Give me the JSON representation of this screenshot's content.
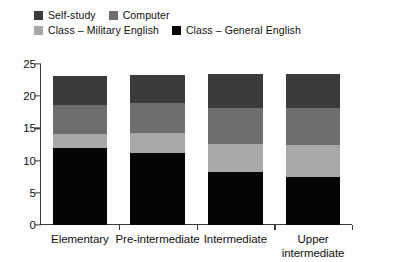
{
  "chart_data": {
    "type": "bar",
    "subtype": "stacked-bar",
    "title": "",
    "xlabel": "",
    "ylabel": "",
    "ylim": [
      0,
      25
    ],
    "yticks": [
      0,
      5,
      10,
      15,
      20,
      25
    ],
    "grid": false,
    "legend_position": "top-left",
    "categories": [
      "Elementary",
      "Pre-intermediate",
      "Intermediate",
      "Upper intermediate"
    ],
    "category_lines": [
      [
        "Elementary"
      ],
      [
        "Pre-intermediate"
      ],
      [
        "Intermediate"
      ],
      [
        "Upper",
        "intermediate"
      ]
    ],
    "series": [
      {
        "name": "Class – General English",
        "color": "#050505",
        "values": [
          12.0,
          11.2,
          8.3,
          7.4
        ]
      },
      {
        "name": "Class – Military English",
        "color": "#a8a8a8",
        "values": [
          2.2,
          3.1,
          4.3,
          5.1
        ]
      },
      {
        "name": "Computer",
        "color": "#6e6e6e",
        "values": [
          4.5,
          4.7,
          5.5,
          5.6
        ]
      },
      {
        "name": "Self-study",
        "color": "#3b3b3b",
        "values": [
          4.5,
          4.3,
          5.3,
          5.4
        ]
      }
    ],
    "totals": [
      23.2,
      23.3,
      23.4,
      23.5
    ],
    "stack_order_bottom_to_top": [
      "Class – General English",
      "Class – Military English",
      "Computer",
      "Self-study"
    ]
  },
  "legend": {
    "rows": [
      [
        {
          "label": "Self-study",
          "color": "#3b3b3b"
        },
        {
          "label": "Computer",
          "color": "#6e6e6e"
        }
      ],
      [
        {
          "label": "Class – Military English",
          "color": "#a8a8a8"
        },
        {
          "label": "Class – General English",
          "color": "#050505"
        }
      ]
    ]
  },
  "axes": {
    "y_tick_labels": [
      "25",
      "20",
      "15",
      "10",
      "5",
      "0"
    ],
    "x_tick_labels": [
      "Elementary",
      "Pre-intermediate",
      "Intermediate",
      "Upper intermediate"
    ]
  }
}
